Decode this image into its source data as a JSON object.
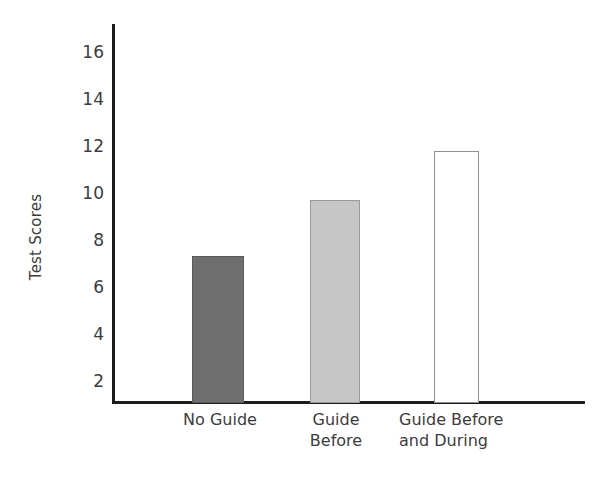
{
  "chart_data": {
    "type": "bar",
    "title": "",
    "subtitle": "",
    "xlabel": "",
    "ylabel": "Test Scores",
    "categories": [
      "No Guide",
      "Guide Before",
      "Guide Before and During"
    ],
    "category_labels_wrapped": [
      "No Guide",
      "Guide\nBefore",
      "Guide Before\nand During"
    ],
    "values": [
      7.3,
      9.7,
      11.8
    ],
    "series": [
      {
        "name": "Test Scores",
        "values": [
          7.3,
          9.7,
          11.8
        ]
      }
    ],
    "bars": [
      {
        "category": "No Guide",
        "label": "No Guide",
        "value": 7.3,
        "fill": "#6e6e6e",
        "stroke": "#5a5a5a"
      },
      {
        "category": "Guide Before",
        "label": "Guide\nBefore",
        "value": 9.7,
        "fill": "#c6c6c6",
        "stroke": "#9a9a9a"
      },
      {
        "category": "Guide Before and During",
        "label": "Guide Before\nand During",
        "value": 11.8,
        "fill": "#ffffff",
        "stroke": "#8f8f8f"
      }
    ],
    "ytick_labels": [
      "16",
      "14",
      "12",
      "10",
      "8",
      "6",
      "4",
      "2"
    ],
    "yticks": [
      16,
      14,
      12,
      10,
      8,
      6,
      4,
      2
    ],
    "ylim": [
      1.05,
      17.0
    ],
    "axis_origin_value": 1.05,
    "grid": false,
    "legend": false,
    "legend_position": "none",
    "axis_color": "#1c1c1c",
    "text_color": "#3c3c3c",
    "background": "#ffffff"
  }
}
